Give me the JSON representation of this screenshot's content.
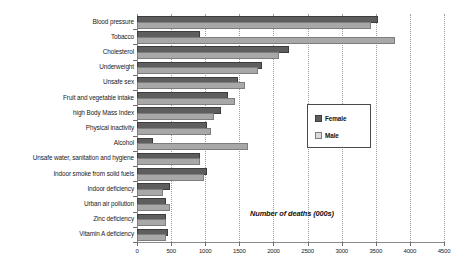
{
  "chart_data": {
    "type": "bar",
    "orientation": "horizontal",
    "title": "",
    "xlabel": "Number of deaths (000s)",
    "ylabel": "",
    "xlim": [
      0,
      4500
    ],
    "xticks": [
      0,
      500,
      1000,
      1500,
      2000,
      2500,
      3000,
      3500,
      4000,
      4500
    ],
    "grid": true,
    "legend_position": "right-middle",
    "categories": [
      "Blood pressure",
      "Tobacco",
      "Cholesterol",
      "Underweight",
      "Unsafe sex",
      "Fruit and vegetable intake",
      "high Body Mass Index",
      "Physical inactivity",
      "Alcohol",
      "Unsafe water, sanitation and hygiene",
      "Indoor smoke from solid fuels",
      "Indoor deficiency",
      "Urban air pollution",
      "Zinc deficiency",
      "Vitamin A deficiency"
    ],
    "series": [
      {
        "name": "Female",
        "color": "#5e5e5e",
        "values": [
          3500,
          900,
          2200,
          1800,
          1450,
          1300,
          1200,
          1000,
          200,
          900,
          1000,
          450,
          400,
          400,
          420
        ]
      },
      {
        "name": "Male",
        "color": "#a8a8a8",
        "values": [
          3400,
          3750,
          2050,
          1750,
          1550,
          1400,
          1100,
          1050,
          1600,
          900,
          950,
          350,
          450,
          400,
          400
        ]
      }
    ]
  },
  "legend": {
    "items": [
      {
        "label": "Female"
      },
      {
        "label": "Male"
      }
    ]
  },
  "colors": {
    "female": "#5e5e5e",
    "male": "#a8a8a8",
    "axis": "#8a8a8a",
    "grid": "#9b9b9b",
    "text": "#1a1a1a",
    "background": "#ffffff"
  }
}
